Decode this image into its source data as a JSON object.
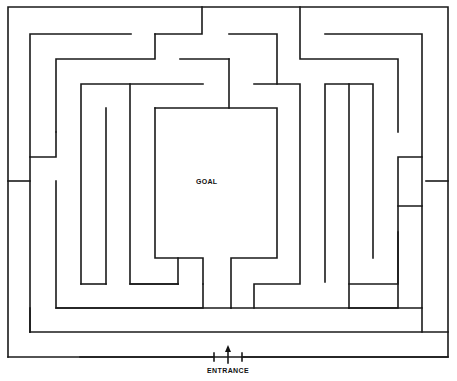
{
  "diagram": {
    "type": "maze",
    "caption": "(caption text cut off at top)",
    "goal_label": "GOAL",
    "entrance_label": "ENTRANCE",
    "entrance_marker": "up-arrow"
  }
}
